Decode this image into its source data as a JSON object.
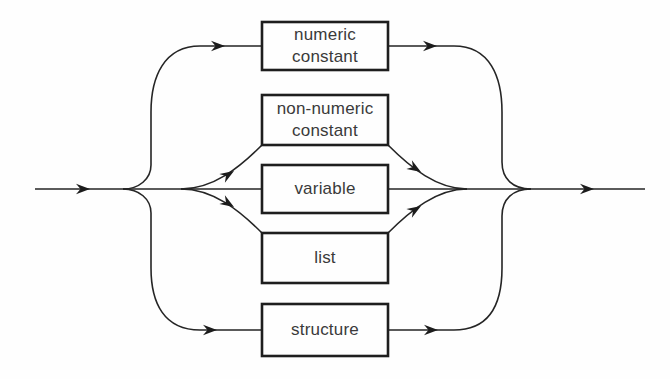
{
  "diagram": {
    "type": "railroad-syntax-diagram",
    "nodes": [
      {
        "id": "numeric-constant",
        "label": "numeric\nconstant"
      },
      {
        "id": "non-numeric-constant",
        "label": "non-numeric\nconstant"
      },
      {
        "id": "variable",
        "label": "variable"
      },
      {
        "id": "list",
        "label": "list"
      },
      {
        "id": "structure",
        "label": "structure"
      }
    ],
    "colors": {
      "background": "#fefefe",
      "line": "#252525",
      "box_border": "#1e1e1e",
      "text": "#3a3a3a"
    }
  }
}
